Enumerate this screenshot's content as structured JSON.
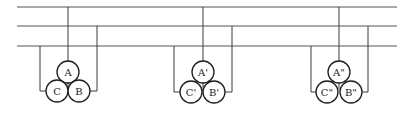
{
  "diagram": {
    "type": "three-phase busbar with three single-core cable groups (trefoil)",
    "colors": {
      "line": "#3a3a3a",
      "circle": "#1e1e1e",
      "background": "#ffffff"
    },
    "buses": [
      {
        "name": "bus-1",
        "y": 7
      },
      {
        "name": "bus-2",
        "y": 26
      },
      {
        "name": "bus-3",
        "y": 46
      }
    ],
    "groups": [
      {
        "name": "group-1",
        "cables": [
          {
            "label": "A",
            "connects_to": "bus-1"
          },
          {
            "label": "C",
            "connects_to": "bus-3"
          },
          {
            "label": "B",
            "connects_to": "bus-2"
          }
        ]
      },
      {
        "name": "group-2",
        "cables": [
          {
            "label": "A'",
            "connects_to": "bus-1"
          },
          {
            "label": "C'",
            "connects_to": "bus-3"
          },
          {
            "label": "B'",
            "connects_to": "bus-2"
          }
        ]
      },
      {
        "name": "group-3",
        "cables": [
          {
            "label": "A\"",
            "connects_to": "bus-1"
          },
          {
            "label": "C\"",
            "connects_to": "bus-3"
          },
          {
            "label": "B\"",
            "connects_to": "bus-2"
          }
        ]
      }
    ]
  }
}
